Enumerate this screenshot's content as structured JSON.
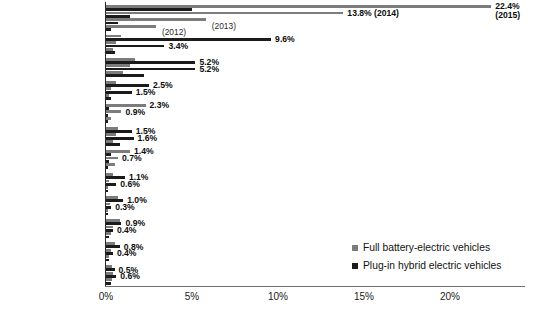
{
  "chart_data": {
    "type": "bar",
    "orientation": "horizontal",
    "title": "",
    "xlabel": "",
    "ylabel": "",
    "xlim": [
      0,
      25
    ],
    "xticks": [
      "0%",
      "5%",
      "10%",
      "15%",
      "20%"
    ],
    "xtick_values": [
      0,
      5,
      10,
      15,
      20
    ],
    "grid": false,
    "legend_position": "bottom-right",
    "legend": [
      {
        "key": "bev",
        "label": "Full battery-electric vehicles",
        "color": "#7c7c7c"
      },
      {
        "key": "phev",
        "label": "Plug-in hybrid electric vehicles",
        "color": "#1b1b1b"
      }
    ],
    "series": [
      {
        "name": "Full battery-electric vehicles",
        "key": "bev",
        "color": "#7c7c7c"
      },
      {
        "name": "Plug-in hybrid electric vehicles",
        "key": "phev",
        "color": "#1b1b1b"
      }
    ],
    "categories": [
      "Norway",
      "Netherlands",
      "California",
      "Sweden",
      "Denmark",
      "US (incl. California)",
      "France",
      "United Kingdom",
      "China",
      "Austria",
      "Germany",
      "Japan"
    ],
    "groups": [
      {
        "category": "Norway",
        "bars": [
          {
            "key": "bev",
            "value": 22.4,
            "label": "22.4%",
            "annot": "(2015)"
          },
          {
            "key": "phev",
            "value": 5.0,
            "label": "",
            "annot": ""
          },
          {
            "key": "bev",
            "value": 13.8,
            "label": "13.8%",
            "annot": "(2014)"
          },
          {
            "key": "phev",
            "value": 1.4,
            "label": "",
            "annot": ""
          },
          {
            "key": "bev",
            "value": 5.8,
            "label": "",
            "annot": "(2013)"
          },
          {
            "key": "phev",
            "value": 0.7,
            "label": "",
            "annot": ""
          },
          {
            "key": "bev",
            "value": 2.9,
            "label": "",
            "annot": "(2012)"
          },
          {
            "key": "phev",
            "value": 0.3,
            "label": "",
            "annot": ""
          }
        ]
      },
      {
        "category": "Netherlands",
        "bars": [
          {
            "key": "bev",
            "value": 0.9,
            "label": "",
            "annot": ""
          },
          {
            "key": "phev",
            "value": 9.6,
            "label": "9.6%",
            "annot": ""
          },
          {
            "key": "bev",
            "value": 0.6,
            "label": "",
            "annot": ""
          },
          {
            "key": "phev",
            "value": 3.4,
            "label": "3.4%",
            "annot": ""
          },
          {
            "key": "bev",
            "value": 0.4,
            "label": "",
            "annot": ""
          },
          {
            "key": "phev",
            "value": 0.5,
            "label": "",
            "annot": ""
          }
        ]
      },
      {
        "category": "California",
        "bars": [
          {
            "key": "bev",
            "value": 1.7,
            "label": "",
            "annot": ""
          },
          {
            "key": "phev",
            "value": 5.2,
            "label": "5.2%",
            "annot": ""
          },
          {
            "key": "bev",
            "value": 1.4,
            "label": "",
            "annot": ""
          },
          {
            "key": "phev",
            "value": 5.2,
            "label": "5.2%",
            "annot": ""
          },
          {
            "key": "bev",
            "value": 1.0,
            "label": "",
            "annot": ""
          },
          {
            "key": "phev",
            "value": 2.2,
            "label": "",
            "annot": ""
          }
        ]
      },
      {
        "category": "Sweden",
        "bars": [
          {
            "key": "bev",
            "value": 0.6,
            "label": "",
            "annot": ""
          },
          {
            "key": "phev",
            "value": 2.5,
            "label": "2.5%",
            "annot": ""
          },
          {
            "key": "bev",
            "value": 0.3,
            "label": "",
            "annot": ""
          },
          {
            "key": "phev",
            "value": 1.5,
            "label": "1.5%",
            "annot": ""
          },
          {
            "key": "bev",
            "value": 0.15,
            "label": "",
            "annot": ""
          },
          {
            "key": "phev",
            "value": 0.3,
            "label": "",
            "annot": ""
          }
        ]
      },
      {
        "category": "Denmark",
        "bars": [
          {
            "key": "bev",
            "value": 2.3,
            "label": "2.3%",
            "annot": ""
          },
          {
            "key": "phev",
            "value": 0.2,
            "label": "",
            "annot": ""
          },
          {
            "key": "bev",
            "value": 0.9,
            "label": "0.9%",
            "annot": ""
          },
          {
            "key": "phev",
            "value": 0.1,
            "label": "",
            "annot": ""
          },
          {
            "key": "bev",
            "value": 0.3,
            "label": "",
            "annot": ""
          },
          {
            "key": "phev",
            "value": 0.05,
            "label": "",
            "annot": ""
          }
        ]
      },
      {
        "category": "US (incl. California)",
        "bars": [
          {
            "key": "bev",
            "value": 0.7,
            "label": "",
            "annot": ""
          },
          {
            "key": "phev",
            "value": 1.5,
            "label": "1.5%",
            "annot": ""
          },
          {
            "key": "bev",
            "value": 0.6,
            "label": "",
            "annot": ""
          },
          {
            "key": "phev",
            "value": 1.6,
            "label": "1.6%",
            "annot": ""
          },
          {
            "key": "bev",
            "value": 0.4,
            "label": "",
            "annot": ""
          },
          {
            "key": "phev",
            "value": 0.8,
            "label": "",
            "annot": ""
          }
        ]
      },
      {
        "category": "France",
        "bars": [
          {
            "key": "bev",
            "value": 1.4,
            "label": "1.4%",
            "annot": ""
          },
          {
            "key": "phev",
            "value": 0.3,
            "label": "",
            "annot": ""
          },
          {
            "key": "bev",
            "value": 0.7,
            "label": "0.7%",
            "annot": ""
          },
          {
            "key": "phev",
            "value": 0.2,
            "label": "",
            "annot": ""
          },
          {
            "key": "bev",
            "value": 0.5,
            "label": "",
            "annot": ""
          },
          {
            "key": "phev",
            "value": 0.1,
            "label": "",
            "annot": ""
          }
        ]
      },
      {
        "category": "United Kingdom",
        "bars": [
          {
            "key": "bev",
            "value": 0.4,
            "label": "",
            "annot": ""
          },
          {
            "key": "phev",
            "value": 1.1,
            "label": "1.1%",
            "annot": ""
          },
          {
            "key": "bev",
            "value": 0.2,
            "label": "",
            "annot": ""
          },
          {
            "key": "phev",
            "value": 0.6,
            "label": "0.6%",
            "annot": ""
          },
          {
            "key": "bev",
            "value": 0.1,
            "label": "",
            "annot": ""
          },
          {
            "key": "phev",
            "value": 0.1,
            "label": "",
            "annot": ""
          }
        ]
      },
      {
        "category": "China",
        "bars": [
          {
            "key": "bev",
            "value": 0.7,
            "label": "",
            "annot": ""
          },
          {
            "key": "phev",
            "value": 1.0,
            "label": "1.0%",
            "annot": ""
          },
          {
            "key": "bev",
            "value": 0.25,
            "label": "",
            "annot": ""
          },
          {
            "key": "phev",
            "value": 0.3,
            "label": "0.3%",
            "annot": ""
          },
          {
            "key": "bev",
            "value": 0.1,
            "label": "",
            "annot": ""
          },
          {
            "key": "phev",
            "value": 0.1,
            "label": "",
            "annot": ""
          }
        ]
      },
      {
        "category": "Austria",
        "bars": [
          {
            "key": "bev",
            "value": 0.8,
            "label": "",
            "annot": ""
          },
          {
            "key": "phev",
            "value": 0.9,
            "label": "0.9%",
            "annot": ""
          },
          {
            "key": "bev",
            "value": 0.4,
            "label": "",
            "annot": ""
          },
          {
            "key": "phev",
            "value": 0.4,
            "label": "0.4%",
            "annot": ""
          },
          {
            "key": "bev",
            "value": 0.3,
            "label": "",
            "annot": ""
          },
          {
            "key": "phev",
            "value": 0.2,
            "label": "",
            "annot": ""
          }
        ]
      },
      {
        "category": "Germany",
        "bars": [
          {
            "key": "bev",
            "value": 0.55,
            "label": "",
            "annot": ""
          },
          {
            "key": "phev",
            "value": 0.8,
            "label": "0.8%",
            "annot": ""
          },
          {
            "key": "bev",
            "value": 0.3,
            "label": "",
            "annot": ""
          },
          {
            "key": "phev",
            "value": 0.4,
            "label": "0.4%",
            "annot": ""
          },
          {
            "key": "bev",
            "value": 0.2,
            "label": "",
            "annot": ""
          },
          {
            "key": "phev",
            "value": 0.15,
            "label": "",
            "annot": ""
          }
        ]
      },
      {
        "category": "Japan",
        "bars": [
          {
            "key": "bev",
            "value": 0.35,
            "label": "",
            "annot": ""
          },
          {
            "key": "phev",
            "value": 0.5,
            "label": "0.5%",
            "annot": ""
          },
          {
            "key": "bev",
            "value": 0.4,
            "label": "",
            "annot": ""
          },
          {
            "key": "phev",
            "value": 0.6,
            "label": "0.6%",
            "annot": ""
          },
          {
            "key": "bev",
            "value": 0.35,
            "label": "",
            "annot": ""
          },
          {
            "key": "phev",
            "value": 0.3,
            "label": "",
            "annot": ""
          }
        ]
      }
    ]
  }
}
